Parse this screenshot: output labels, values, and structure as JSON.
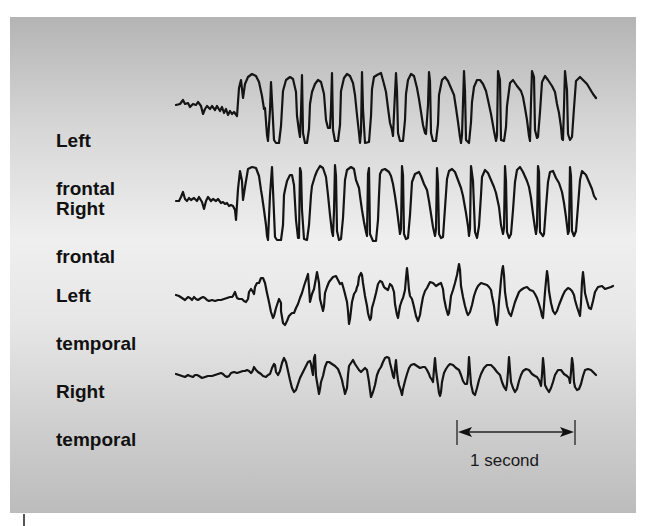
{
  "figure": {
    "background_gradient": [
      "#b4b4b4",
      "#efefef",
      "#bcbcbc"
    ],
    "trace_color": "#141414"
  },
  "channels": [
    {
      "label_line1": "Left",
      "label_line2": "frontal",
      "points": "176,105 180,104 183,100 185,104 188,103 190,107 193,104 196,105 198,102 201,106 203,114 205,109 207,106 210,109 212,106 215,110 217,106 220,111 222,107 224,113 226,109 228,115 230,111 232,114 234,112 237,116 239,88 241,80 243,98 245,84 248,77 252,74 256,76 259,82 262,96 264,109 265,108 267,135 268,141 270,110 271,82 272,101 274,140 276,143 279,143 281,126 283,91 286,80 290,77 293,79 296,92 297,116 299,131 300,137 301,112 302,75 303,133 305,143 307,143 309,129 310,104 312,92 315,84 318,80 321,82 324,94 326,120 328,128 330,128 331,108 332,73 333,130 335,141 338,141 340,125 341,91 344,78 347,74 350,76 353,83 355,95 357,115 359,133 360,143 361,132 362,72 363,109 365,143 369,142 371,116 372,89 374,77 377,75 381,73 384,84 386,92 388,108 390,123 392,130 393,136 394,114 396,73 397,91 398,133 400,141 403,141 405,120 406,94 408,80 411,74 414,76 417,88 419,99 421,112 423,125 425,133 426,134 428,105 429,72 430,81 431,133 433,141 436,141 438,124 439,95 442,80 445,77 448,81 451,88 454,95 456,108 458,122 460,137 461,143 462,135 464,71 465,91 466,140 469,143 471,122 472,102 474,87 477,80 480,80 483,84 486,91 488,100 491,114 494,131 496,141 497,136 498,71 500,80 501,140 504,141 506,127 507,106 510,83 513,80 517,86 521,91 523,97 525,108 527,120 529,136 530,141 531,102 532,71 534,77 535,130 537,138 538,137 540,112 542,82 545,76 548,80 552,86 555,92 557,104 559,113 561,127 562,139 563,140 564,107 565,71 567,90 568,134 570,140 572,137 574,108 576,81 580,77 584,81 587,84 590,89 593,94 596,98"
    },
    {
      "label_line1": "Right",
      "label_line2": "frontal",
      "points": "176,201 179,201 181,197 183,192 185,199 187,201 189,198 191,200 194,198 197,201 199,197 202,202 204,209 206,201 208,197 211,201 213,199 216,201 218,199 221,203 223,202 225,204 227,203 229,206 231,205 233,206 235,210 236,220 238,189 240,171 242,181 243,200 245,187 248,169 252,167 256,168 259,176 261,190 262,196 264,210 266,225 267,236 268,240 270,195 272,167 273,190 275,237 277,240 281,240 283,225 284,195 285,190 287,181 290,175 292,175 294,185 296,220 298,238 299,238 300,168 301,172 302,210 304,239 307,240 309,225 311,195 312,186 315,176 317,171 320,166 323,168 326,177 328,195 330,215 332,232 333,236 334,211 335,165 336,176 337,231 339,240 341,239 343,218 345,180 347,170 351,167 354,169 356,180 359,188 360,196 362,210 364,222 366,232 367,236 368,174 369,168 370,234 373,241 376,241 378,220 379,195 380,174 382,170 385,169 389,172 391,176 393,184 395,196 397,210 399,226 400,234 401,229 402,166 403,175 404,234 406,239 408,238 410,215 412,182 415,174 419,172 421,176 424,184 427,190 429,201 431,214 433,227 435,236 436,229 437,168 438,183 439,234 441,238 443,237 445,208 447,179 449,171 452,169 455,172 458,180 461,188 463,196 466,213 468,226 469,236 470,228 471,166 473,181 475,232 477,238 479,226 481,195 482,177 485,170 488,173 491,180 494,187 496,193 499,207 501,225 503,234 504,228 505,166 506,181 507,232 509,238 511,234 513,210 515,182 517,170 520,167 523,172 527,181 529,187 531,198 533,214 535,228 536,234 537,226 538,166 539,172 540,232 543,236 544,234 546,207 548,182 550,172 553,171 556,178 559,183 562,192 564,203 566,217 568,234 569,231 570,167 571,176 572,231 574,236 576,231 578,206 580,180 582,171 586,175 589,182 592,189 594,196 596,199"
    },
    {
      "label_line1": "Left",
      "label_line2": "temporal",
      "points": "176,295 179,296 182,298 185,300 188,297 190,298 192,300 194,297 196,299 198,300 201,298 203,297 205,298 207,300 209,301 212,300 215,301 218,300 221,300 224,299 227,298 230,297 232,297 233,296 235,292 237,298 239,299 242,299 244,301 246,302 248,299 249,292 251,289 253,292 254,294 255,287 257,283 259,283 261,278 263,278 265,283 267,293 269,302 271,312 273,318 274,316 276,308 278,302 279,299 281,303 281,311 283,323 285,325 287,321 289,316 292,313 294,313 296,308 298,304 300,298 302,293 304,286 306,280 308,274 309,287 310,302 312,294 314,289 316,278 317,272 319,283 320,299 322,307 323,311 324,306 325,293 327,287 329,282 333,277 336,276 338,280 340,284 342,283 344,290 346,298 347,302 348,311 349,324 350,319 352,302 354,294 356,291 357,287 358,285 359,277 361,273 362,275 363,283 365,296 367,306 368,313 369,317 370,320 371,318 372,308 374,301 376,293 378,284 380,281 382,282 384,287 385,288 388,290 390,284 392,286 394,292 395,304 397,315 398,318 400,306 402,300 403,298 405,290 406,278 407,268 408,278 409,290 410,296 412,299 414,307 416,316 418,321 420,315 421,308 423,297 425,291 427,288 430,282 433,283 436,286 439,284 441,283 443,289 444,298 446,308 448,315 449,313 450,305 451,296 453,290 455,283 456,279 457,275 459,264 460,270 461,286 463,297 465,306 467,313 468,315 470,312 472,305 474,296 476,290 478,286 481,283 484,284 487,285 489,287 491,290 492,296 494,306 495,315 496,322 497,325 498,317 499,302 500,292 501,280 502,271 503,266 504,275 505,292 507,306 509,313 511,316 513,309 515,302 517,297 519,292 521,290 524,288 527,287 530,290 533,291 535,294 537,298 539,304 541,311 542,316 543,318 544,305 545,292 546,281 547,271 548,278 549,291 551,303 553,311 555,314 557,311 559,305 561,300 563,295 565,291 568,288 570,289 572,291 574,295 575,300 577,307 579,313 580,316 581,303 582,282 583,272 584,281 585,293 587,301 589,308 591,309 593,301 595,292 598,287 602,286 605,289 608,288 611,287 613,286"
    },
    {
      "label_line1": "Right",
      "label_line2": "temporal",
      "points": "176,374 179,375 182,376 185,377 188,375 190,376 193,377 195,375 197,375 199,376 202,378 205,377 208,376 212,376 215,375 218,374 221,373 223,374 225,376 227,377 229,376 231,373 234,372 237,373 240,372 243,371 245,371 247,370 249,371 251,373 252,372 253,370 254,367 256,370 258,372 261,374 263,376 266,377 268,375 270,374 272,368 274,364 275,365 276,372 278,375 280,371 282,363 284,358 286,362 288,371 290,380 292,388 294,392 296,390 298,384 300,378 302,374 304,370 306,366 308,362 310,361 311,364 312,370 313,375 314,358 315,355 316,376 318,388 319,394 320,389 321,382 323,376 325,367 327,362 329,362 332,364 335,366 338,369 340,374 342,380 343,385 344,389 345,394 347,388 348,375 349,366 351,363 353,360 355,364 357,367 359,370 361,372 363,370 365,368 367,370 368,376 369,382 370,390 371,397 373,392 375,385 377,375 379,370 381,367 383,362 385,358 387,357 389,358 390,363 392,371 393,376 394,378 395,368 396,360 397,372 398,380 399,385 401,391 402,395 403,389 405,381 407,374 409,368 411,365 414,364 417,366 420,368 423,367 425,367 427,370 429,374 430,377 432,380 433,382 434,369 435,358 436,370 437,378 438,385 439,393 440,396 441,392 442,382 444,373 446,369 448,366 450,364 453,365 456,368 459,370 461,375 463,381 465,384 467,384 468,375 469,357 470,371 471,384 473,393 475,395 477,388 479,380 481,374 484,368 487,365 491,365 494,368 497,372 500,375 502,382 504,387 506,390 507,384 508,372 509,357 510,370 511,382 513,388 515,392 517,389 519,381 521,375 523,371 526,369 529,370 532,374 535,376 537,377 539,380 540,383 541,386 542,375 543,358 544,368 545,385 547,389 549,392 551,388 553,382 555,375 558,370 561,370 564,374 567,376 569,378 570,383 571,372 572,358 573,365 574,382 575,387 577,390 579,389 581,384 583,376 585,370 588,369 591,370 594,373 596,375"
    }
  ],
  "scale_bar": {
    "label": "1 second",
    "x_start": 457,
    "x_end": 575,
    "y": 432
  }
}
